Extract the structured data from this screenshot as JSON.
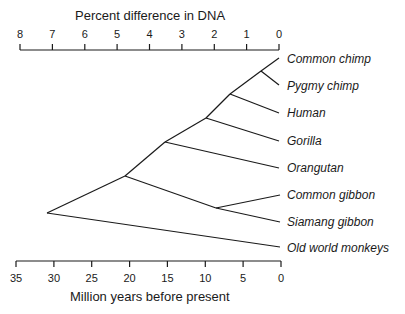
{
  "diagram": {
    "type": "phylogenetic_tree",
    "top_axis": {
      "title": "Percent difference in DNA",
      "ticks": [
        "8",
        "7",
        "6",
        "5",
        "4",
        "3",
        "2",
        "1",
        "0"
      ]
    },
    "bottom_axis": {
      "title": "Million years before present",
      "ticks": [
        "35",
        "30",
        "25",
        "20",
        "15",
        "10",
        "5",
        "0"
      ]
    },
    "taxa": [
      "Common chimp",
      "Pygmy chimp",
      "Human",
      "Gorilla",
      "Orangutan",
      "Common gibbon",
      "Siamang gibbon",
      "Old world monkeys"
    ],
    "line_color": "#1a1a1a"
  }
}
